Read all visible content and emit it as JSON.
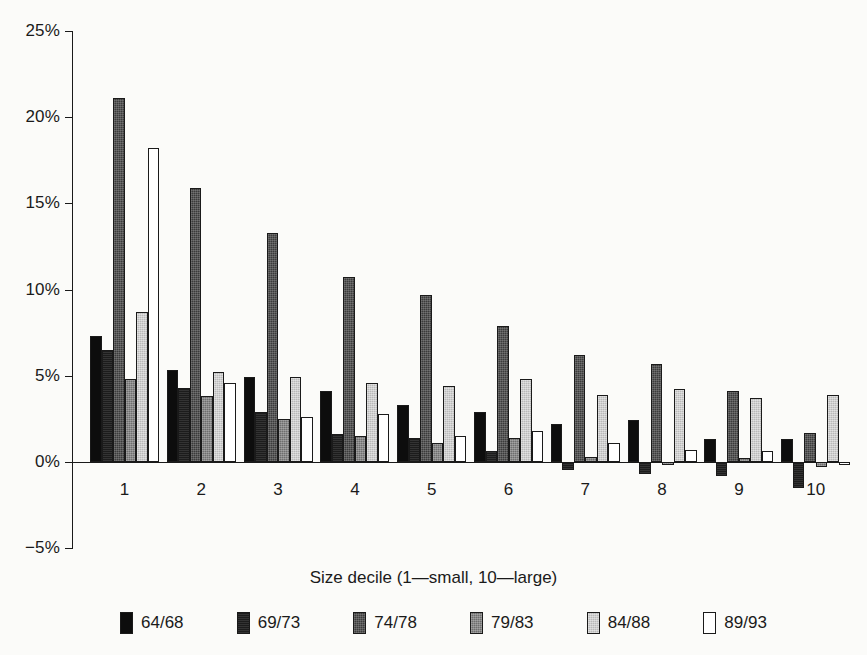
{
  "chart_data": {
    "type": "bar",
    "title": "",
    "xlabel": "Size decile (1—small, 10—large)",
    "ylabel": "",
    "categories": [
      "1",
      "2",
      "3",
      "4",
      "5",
      "6",
      "7",
      "8",
      "9",
      "10"
    ],
    "ylim": [
      -5,
      25
    ],
    "yticks": [
      -5,
      0,
      5,
      10,
      15,
      20,
      25
    ],
    "ytick_labels": [
      "−5%",
      "0%",
      "5%",
      "10%",
      "15%",
      "20%",
      "25%"
    ],
    "grid": false,
    "legend_position": "bottom",
    "value_unit": "percent",
    "series": [
      {
        "name": "64/68",
        "color": "#0d0d0d",
        "values": [
          7.3,
          5.3,
          4.9,
          4.1,
          3.3,
          2.9,
          2.2,
          2.4,
          1.3,
          1.3
        ]
      },
      {
        "name": "69/73",
        "color": "#1c1c1c",
        "values": [
          6.5,
          4.3,
          2.9,
          1.6,
          1.4,
          0.6,
          -0.5,
          -0.7,
          -0.8,
          -1.5
        ]
      },
      {
        "name": "74/78",
        "color": "#3b3b3b",
        "values": [
          21.1,
          15.9,
          13.3,
          10.7,
          9.7,
          7.9,
          6.2,
          5.7,
          4.1,
          1.7
        ]
      },
      {
        "name": "79/83",
        "color": "#6e6e6e",
        "values": [
          4.8,
          3.8,
          2.5,
          1.5,
          1.1,
          1.4,
          0.3,
          -0.2,
          0.2,
          -0.3
        ]
      },
      {
        "name": "84/88",
        "color": "#b9b9b9",
        "values": [
          8.7,
          5.2,
          4.9,
          4.6,
          4.4,
          4.8,
          3.9,
          4.2,
          3.7,
          3.9
        ]
      },
      {
        "name": "89/93",
        "color": "#ffffff",
        "values": [
          18.2,
          4.6,
          2.6,
          2.8,
          1.5,
          1.8,
          1.1,
          0.7,
          0.6,
          -0.2
        ]
      }
    ]
  },
  "legend": {
    "items": [
      {
        "label": "64/68",
        "swatch": "s0"
      },
      {
        "label": "69/73",
        "swatch": "s1"
      },
      {
        "label": "74/78",
        "swatch": "s2"
      },
      {
        "label": "79/83",
        "swatch": "s3"
      },
      {
        "label": "84/88",
        "swatch": "s4"
      },
      {
        "label": "89/93",
        "swatch": "s5"
      }
    ]
  }
}
